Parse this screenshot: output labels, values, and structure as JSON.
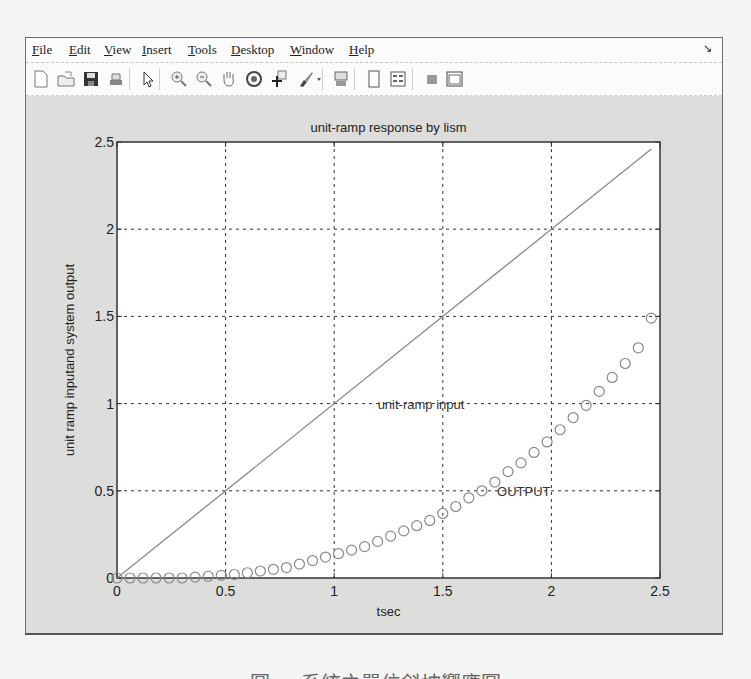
{
  "window": {
    "menu": [
      {
        "label": "File",
        "mnemonic": "F",
        "rest": "ile",
        "x": 6
      },
      {
        "label": "Edit",
        "mnemonic": "E",
        "rest": "dit",
        "x": 43
      },
      {
        "label": "View",
        "mnemonic": "V",
        "rest": "iew",
        "x": 78
      },
      {
        "label": "Insert",
        "mnemonic": "I",
        "rest": "nsert",
        "x": 116
      },
      {
        "label": "Tools",
        "mnemonic": "T",
        "rest": "ools",
        "x": 162
      },
      {
        "label": "Desktop",
        "mnemonic": "D",
        "rest": "esktop",
        "x": 205
      },
      {
        "label": "Window",
        "mnemonic": "W",
        "rest": "indow",
        "x": 264
      },
      {
        "label": "Help",
        "mnemonic": "H",
        "rest": "elp",
        "x": 323
      }
    ],
    "dock_icon": "dock-arrow-icon",
    "toolbar": [
      {
        "name": "new-figure-icon",
        "x": 5
      },
      {
        "name": "open-file-icon",
        "x": 30
      },
      {
        "name": "save-figure-icon",
        "x": 55
      },
      {
        "name": "print-figure-icon",
        "x": 80
      },
      {
        "name": "edit-plot-arrow-icon",
        "x": 112
      },
      {
        "name": "zoom-in-icon",
        "x": 143
      },
      {
        "name": "zoom-out-icon",
        "x": 168
      },
      {
        "name": "pan-hand-icon",
        "x": 193
      },
      {
        "name": "rotate-3d-icon",
        "x": 218
      },
      {
        "name": "data-cursor-icon",
        "x": 243
      },
      {
        "name": "brush-icon",
        "x": 270
      },
      {
        "name": "link-plot-icon",
        "x": 305
      },
      {
        "name": "colorbar-icon",
        "x": 338
      },
      {
        "name": "legend-icon",
        "x": 362
      },
      {
        "name": "hide-plot-tools-icon",
        "x": 396
      },
      {
        "name": "show-plot-tools-icon",
        "x": 418
      }
    ]
  },
  "chart_data": {
    "type": "line",
    "title": "unit-ramp response by lism",
    "xlabel": "tsec",
    "ylabel": "unit ramp inputand system output",
    "xlim": [
      0,
      2.5
    ],
    "ylim": [
      0,
      2.5
    ],
    "xticks": [
      "0",
      "0.5",
      "1",
      "1.5",
      "2",
      "2.5"
    ],
    "yticks": [
      "0",
      "0.5",
      "1",
      "1.5",
      "2",
      "2.5"
    ],
    "grid": true,
    "annotations": [
      {
        "text": "unit-ramp input",
        "x": 1.2,
        "y": 1.0
      },
      {
        "text": "OUTPUT",
        "x": 1.75,
        "y": 0.5
      }
    ],
    "series": [
      {
        "name": "unit-ramp input",
        "style": "solid line",
        "color": "#8a8a8a",
        "x": [
          0,
          2.46
        ],
        "y": [
          0,
          2.46
        ]
      },
      {
        "name": "OUTPUT",
        "style": "circle markers",
        "color": "#8a8a8a",
        "x": [
          0,
          0.06,
          0.12,
          0.18,
          0.24,
          0.3,
          0.36,
          0.42,
          0.48,
          0.54,
          0.6,
          0.66,
          0.72,
          0.78,
          0.84,
          0.9,
          0.96,
          1.02,
          1.08,
          1.14,
          1.2,
          1.26,
          1.32,
          1.38,
          1.44,
          1.5,
          1.56,
          1.62,
          1.68,
          1.74,
          1.8,
          1.86,
          1.92,
          1.98,
          2.04,
          2.1,
          2.16,
          2.22,
          2.28,
          2.34,
          2.4,
          2.46
        ],
        "y": [
          0,
          0,
          0,
          0,
          0,
          0,
          0.005,
          0.01,
          0.015,
          0.02,
          0.03,
          0.04,
          0.05,
          0.06,
          0.08,
          0.1,
          0.12,
          0.14,
          0.16,
          0.18,
          0.21,
          0.24,
          0.27,
          0.3,
          0.33,
          0.37,
          0.41,
          0.46,
          0.5,
          0.55,
          0.61,
          0.66,
          0.72,
          0.78,
          0.85,
          0.92,
          0.99,
          1.07,
          1.15,
          1.23,
          1.32,
          1.49
        ]
      }
    ]
  },
  "caption": "圖 ... 系統之單位斜坡響應圖"
}
